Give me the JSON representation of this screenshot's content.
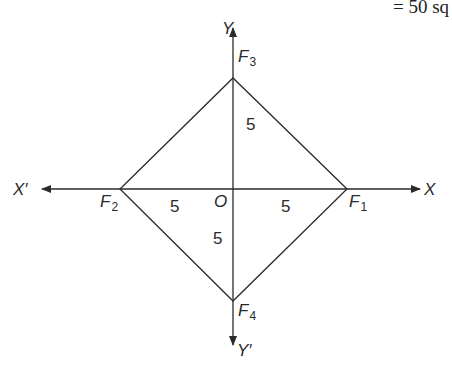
{
  "top_note": "= 50 sq",
  "axes": {
    "x_pos": "X",
    "x_neg": "X′",
    "y_pos": "Y",
    "y_neg": "Y′",
    "origin": "O"
  },
  "points": {
    "F1": {
      "base": "F",
      "sub": "1"
    },
    "F2": {
      "base": "F",
      "sub": "2"
    },
    "F3": {
      "base": "F",
      "sub": "3"
    },
    "F4": {
      "base": "F",
      "sub": "4"
    }
  },
  "distances": {
    "OF1": "5",
    "OF2": "5",
    "OF3": "5",
    "OF4": "5"
  },
  "colors": {
    "line": "#2a2a2a",
    "background": "#ffffff"
  }
}
